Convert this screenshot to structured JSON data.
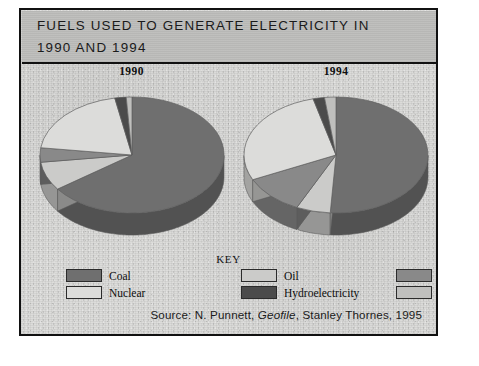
{
  "header": {
    "title_line1": "FUELS USED TO GENERATE ELECTRICITY IN",
    "title_line2": "1990 AND 1994"
  },
  "key": {
    "heading": "KEY",
    "items": [
      {
        "label": "Coal",
        "color": "#6f6f6f"
      },
      {
        "label": "Oil",
        "color": "#cbcbc9"
      },
      {
        "label": "Gas",
        "color": "#898989"
      },
      {
        "label": "Nuclear",
        "color": "#dcdcda"
      },
      {
        "label": "Hydroelectricity",
        "color": "#4b4b4b"
      },
      {
        "label": "Other",
        "color": "#bfbfbd"
      }
    ]
  },
  "source": {
    "prefix": "Source: N. Punnett, ",
    "italic": "Geofile",
    "suffix": ", Stanley Thornes, 1995"
  },
  "chart_data": [
    {
      "type": "pie",
      "title": "1990",
      "labels": [
        "Coal",
        "Oil",
        "Gas",
        "Nuclear",
        "Hydroelectricity",
        "Other"
      ],
      "colors": [
        "#6f6f6f",
        "#cbcbc9",
        "#898989",
        "#dcdcda",
        "#4b4b4b",
        "#bfbfbd"
      ],
      "values": [
        65,
        8,
        4,
        20,
        2,
        1
      ],
      "unit": "%",
      "start_angle_deg": -90,
      "direction": "clockwise",
      "three_d": true,
      "legend_position": "below-shared"
    },
    {
      "type": "pie",
      "title": "1994",
      "labels": [
        "Coal",
        "Oil",
        "Gas",
        "Nuclear",
        "Hydroelectricity",
        "Other"
      ],
      "colors": [
        "#6f6f6f",
        "#cbcbc9",
        "#898989",
        "#dcdcda",
        "#4b4b4b",
        "#bfbfbd"
      ],
      "values": [
        51,
        6,
        11,
        28,
        2,
        2
      ],
      "unit": "%",
      "start_angle_deg": -90,
      "direction": "clockwise",
      "three_d": true,
      "legend_position": "below-shared"
    }
  ]
}
